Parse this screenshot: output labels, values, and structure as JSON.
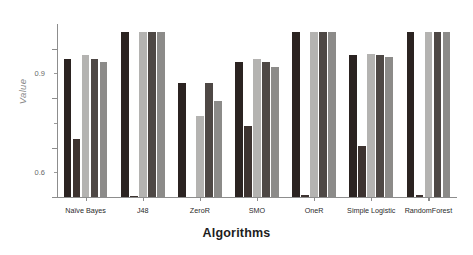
{
  "chart_data": {
    "type": "bar",
    "title": "",
    "subtitle": "",
    "xlabel": "Algorithms",
    "ylabel": "Value",
    "ylim": [
      0.0,
      1.05
    ],
    "yticks": [
      0.0,
      0.3,
      0.6,
      0.9
    ],
    "ytick_labels": [
      "0.0",
      "0.3",
      "0.6",
      "0.9"
    ],
    "grid": false,
    "legend": "none",
    "categories": [
      "Naïve Bayes",
      "J48",
      "ZeroR",
      "SMO",
      "OneR",
      "Simple Logistic",
      "RandomForest"
    ],
    "series": [
      {
        "name": "series-1",
        "color": "#2b2321",
        "values": [
          0.84,
          1.0,
          0.69,
          0.82,
          1.0,
          0.86,
          1.0
        ]
      },
      {
        "name": "series-2",
        "color": "#3d3330",
        "values": [
          0.35,
          0.005,
          0.0,
          0.43,
          0.01,
          0.31,
          0.01
        ]
      },
      {
        "name": "series-3",
        "color": "#b4b3b1",
        "values": [
          0.86,
          1.0,
          0.49,
          0.84,
          1.0,
          0.87,
          1.0
        ]
      },
      {
        "name": "series-4",
        "color": "#4e4845",
        "values": [
          0.84,
          1.0,
          0.69,
          0.82,
          1.0,
          0.86,
          1.0
        ]
      },
      {
        "name": "series-5",
        "color": "#8c8b89",
        "values": [
          0.82,
          1.0,
          0.58,
          0.79,
          1.0,
          0.85,
          1.0
        ]
      }
    ],
    "axis_color": "#8d8d8d",
    "background": "#ffffff"
  }
}
